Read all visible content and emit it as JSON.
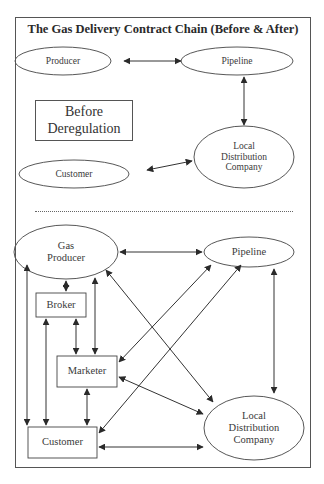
{
  "title": "The Gas Delivery Contract Chain (Before & After)",
  "before": {
    "label_line1": "Before",
    "label_line2": "Deregulation",
    "nodes": {
      "producer": "Producer",
      "pipeline": "Pipeline",
      "ldc_line1": "Local",
      "ldc_line2": "Distribution",
      "ldc_line3": "Company",
      "customer": "Customer"
    },
    "edges": [
      {
        "from": "Producer",
        "to": "Pipeline",
        "direction": "both"
      },
      {
        "from": "Pipeline",
        "to": "Local Distribution Company",
        "direction": "both"
      },
      {
        "from": "Customer",
        "to": "Local Distribution Company",
        "direction": "both"
      }
    ]
  },
  "after": {
    "nodes": {
      "gas_producer_line1": "Gas",
      "gas_producer_line2": "Producer",
      "pipeline": "Pipeline",
      "broker": "Broker",
      "marketer": "Marketer",
      "customer": "Customer",
      "ldc_line1": "Local",
      "ldc_line2": "Distribution",
      "ldc_line3": "Company"
    },
    "edges": [
      {
        "from": "Gas Producer",
        "to": "Pipeline",
        "direction": "both"
      },
      {
        "from": "Gas Producer",
        "to": "Broker",
        "direction": "both"
      },
      {
        "from": "Gas Producer",
        "to": "Marketer",
        "direction": "both"
      },
      {
        "from": "Gas Producer",
        "to": "Customer",
        "direction": "both"
      },
      {
        "from": "Gas Producer",
        "to": "Local Distribution Company",
        "direction": "both"
      },
      {
        "from": "Broker",
        "to": "Marketer",
        "direction": "both"
      },
      {
        "from": "Broker",
        "to": "Customer",
        "direction": "both"
      },
      {
        "from": "Marketer",
        "to": "Pipeline",
        "direction": "both"
      },
      {
        "from": "Marketer",
        "to": "Customer",
        "direction": "both"
      },
      {
        "from": "Marketer",
        "to": "Local Distribution Company",
        "direction": "both"
      },
      {
        "from": "Customer",
        "to": "Pipeline",
        "direction": "both"
      },
      {
        "from": "Customer",
        "to": "Local Distribution Company",
        "direction": "both"
      },
      {
        "from": "Pipeline",
        "to": "Local Distribution Company",
        "direction": "both"
      }
    ]
  },
  "colors": {
    "stroke": "#3a3a3a",
    "text": "#333333",
    "background": "#ffffff"
  }
}
